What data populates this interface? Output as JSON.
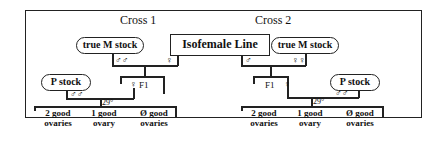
{
  "diagram": {
    "center": {
      "label": "Isofemale Line"
    },
    "cross1": {
      "title": "Cross 1",
      "true_m_stock": "true M stock",
      "true_m_symbol": "♂♂",
      "iso_symbol": "♀",
      "p_stock": "P stock",
      "p_symbol": "♂♂",
      "f1_label": "F1",
      "f1_symbol": "♀",
      "temperature": "29°",
      "outcomes": [
        {
          "line1": "2 good",
          "line2": "ovaries"
        },
        {
          "line1": "1 good",
          "line2": "ovary"
        },
        {
          "line1": "Ø good",
          "line2": "ovaries"
        }
      ]
    },
    "cross2": {
      "title": "Cross 2",
      "true_m_stock": "true M stock",
      "true_m_symbol": "♀♀",
      "iso_symbol": "♂",
      "p_stock": "P stock",
      "p_symbol": "♂♂",
      "f1_label": "F1",
      "f1_symbol": "♀",
      "temperature": "29°",
      "outcomes": [
        {
          "line1": "2 good",
          "line2": "ovaries"
        },
        {
          "line1": "1 good",
          "line2": "ovary"
        },
        {
          "line1": "Ø good",
          "line2": "ovaries"
        }
      ]
    }
  }
}
